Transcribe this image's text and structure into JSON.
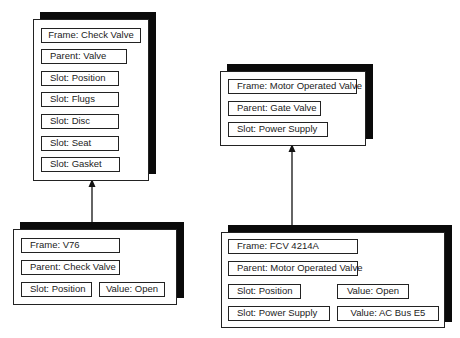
{
  "frames": {
    "check_valve": {
      "frame": "Frame: Check Valve",
      "parent": "Parent: Valve",
      "slots": [
        "Slot: Position",
        "Slot: Flugs",
        "Slot: Disc",
        "Slot: Seat",
        "Slot: Gasket"
      ]
    },
    "v76": {
      "frame": "Frame: V76",
      "parent": "Parent: Check Valve",
      "slot": "Slot: Position",
      "value": "Value: Open"
    },
    "motor_operated_valve": {
      "frame": "Frame: Motor Operated Valve",
      "parent": "Parent: Gate Valve",
      "slot": "Slot: Power Supply"
    },
    "fcv_4214a": {
      "frame": "Frame: FCV 4214A",
      "parent": "Parent: Motor Operated Valve",
      "slot1": "Slot: Position",
      "value1": "Value: Open",
      "slot2": "Slot: Power Supply",
      "value2": "Value: AC Bus E5"
    }
  },
  "arrows": [
    {
      "from": "v76",
      "to": "check_valve"
    },
    {
      "from": "fcv_4214a",
      "to": "motor_operated_valve"
    }
  ]
}
